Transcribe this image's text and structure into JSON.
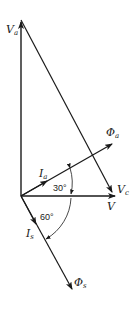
{
  "diagram": {
    "type": "phasor-diagram",
    "colors": {
      "line": "#1a1a1a",
      "background": "#ffffff"
    },
    "phasors": {
      "Va": {
        "symbol": "V",
        "subscript": "a"
      },
      "Vc": {
        "symbol": "V",
        "subscript": "c"
      },
      "V": {
        "symbol": "V",
        "subscript": ""
      },
      "Phi_a": {
        "symbol": "Φ",
        "subscript": "a"
      },
      "Ia": {
        "symbol": "I",
        "subscript": "a"
      },
      "Is": {
        "symbol": "I",
        "subscript": "s"
      },
      "Phi_s": {
        "symbol": "Φ",
        "subscript": "s"
      }
    },
    "angles": {
      "upper": "30°",
      "lower": "60°"
    }
  }
}
